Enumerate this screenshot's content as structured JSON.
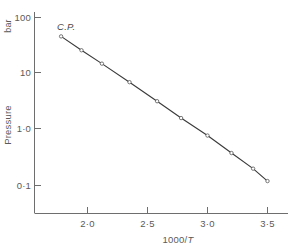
{
  "chart_data": {
    "type": "line",
    "title": "",
    "xlabel": "1000/T",
    "ylabel": "Pressure",
    "yunit": "bar",
    "yscale": "log",
    "xscale": "linear",
    "xlim": [
      1.7,
      3.6
    ],
    "ylim": [
      0.06,
      130
    ],
    "xticks": [
      "2·0",
      "2·5",
      "3·0",
      "3·5"
    ],
    "xtick_values": [
      2.0,
      2.5,
      3.0,
      3.5
    ],
    "yticks": [
      "100",
      "10",
      "1·0",
      "0·1"
    ],
    "ytick_values": [
      100,
      10,
      1.0,
      0.1
    ],
    "grid": false,
    "legend": false,
    "annotations": [
      {
        "text": "C.P.",
        "x": 1.78,
        "y": 46,
        "meaning": "critical-point"
      }
    ],
    "series": [
      {
        "name": "vapour-pressure",
        "x": [
          1.78,
          1.95,
          2.12,
          2.35,
          2.58,
          2.78,
          3.0,
          3.2,
          3.38,
          3.5
        ],
        "y": [
          46,
          26,
          15,
          7.0,
          3.2,
          1.6,
          0.78,
          0.38,
          0.2,
          0.12
        ],
        "marker": "open-circle",
        "line_style": "solid"
      }
    ]
  },
  "axes": {
    "y_unit_label": "bar",
    "y_title": "Pressure",
    "x_title_prefix": "1000/",
    "x_title_var": "T"
  },
  "colors": {
    "axis": "#6e6e6e",
    "line": "#3a3a3a",
    "text": "#5a5a5a",
    "background": "#ffffff"
  }
}
